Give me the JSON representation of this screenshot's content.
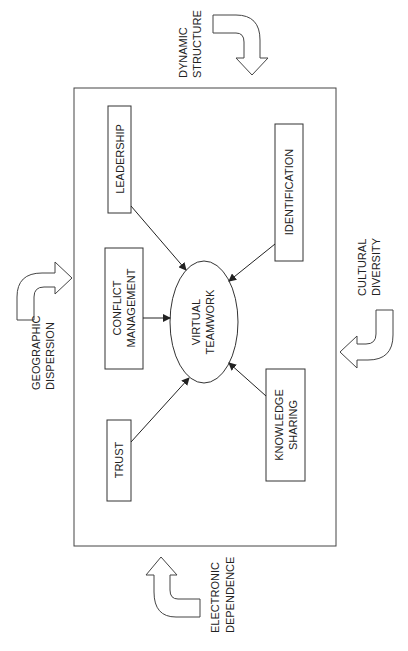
{
  "diagram": {
    "center": {
      "line1": "VIRTUAL",
      "line2": "TEAMWORK"
    },
    "factors": {
      "leadership": "LEADERSHIP",
      "identification": "IDENTIFICATION",
      "conflict_line1": "CONFLICT",
      "conflict_line2": "MANAGEMENT",
      "trust": "TRUST",
      "knowledge_line1": "KNOWLEDGE",
      "knowledge_line2": "SHARING"
    },
    "external": {
      "dynamic_line1": "DYNAMIC",
      "dynamic_line2": "STRUCTURE",
      "geographic_line1": "GEOGRAPHIC",
      "geographic_line2": "DISPERSION",
      "cultural_line1": "CULTURAL",
      "cultural_line2": "DIVERSITY",
      "electronic_line1": "ELECTRONIC",
      "electronic_line2": "DEPENDENCE"
    }
  }
}
